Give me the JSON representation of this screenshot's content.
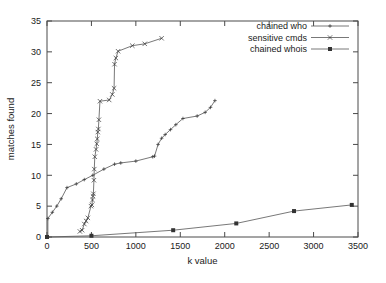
{
  "chart_data": {
    "type": "line",
    "title": "",
    "xlabel": "k value",
    "ylabel": "matches found",
    "xlim": [
      0,
      3500
    ],
    "ylim": [
      0,
      35
    ],
    "xticks": [
      0,
      500,
      1000,
      1500,
      2000,
      2500,
      3000,
      3500
    ],
    "yticks": [
      0,
      5,
      10,
      15,
      20,
      25,
      30,
      35
    ],
    "xtick_labels": [
      "0",
      "500",
      "1000",
      "1500",
      "2000",
      "2500",
      "3000",
      "3500"
    ],
    "ytick_labels": [
      "0",
      "5",
      "10",
      "15",
      "20",
      "25",
      "30",
      "35"
    ],
    "grid": false,
    "legend_position": "top-right",
    "series": [
      {
        "name": "chained who",
        "marker": "plus",
        "points": [
          [
            10,
            0
          ],
          [
            10,
            3
          ],
          [
            60,
            4
          ],
          [
            110,
            5
          ],
          [
            160,
            6.2
          ],
          [
            225,
            8
          ],
          [
            330,
            8.6
          ],
          [
            420,
            9.3
          ],
          [
            515,
            10
          ],
          [
            640,
            11
          ],
          [
            760,
            11.8
          ],
          [
            830,
            12
          ],
          [
            1000,
            12.3
          ],
          [
            1190,
            13
          ],
          [
            1210,
            13.1
          ],
          [
            1250,
            15
          ],
          [
            1290,
            16
          ],
          [
            1330,
            16.6
          ],
          [
            1390,
            17.4
          ],
          [
            1450,
            18.2
          ],
          [
            1530,
            19.2
          ],
          [
            1690,
            19.6
          ],
          [
            1780,
            20.2
          ],
          [
            1840,
            21
          ],
          [
            1890,
            22.1
          ]
        ]
      },
      {
        "name": "sensitive cmds",
        "marker": "cross",
        "points": [
          [
            370,
            0.9
          ],
          [
            395,
            1.1
          ],
          [
            420,
            2.1
          ],
          [
            440,
            2.6
          ],
          [
            460,
            3.1
          ],
          [
            495,
            5
          ],
          [
            505,
            5.2
          ],
          [
            512,
            6
          ],
          [
            518,
            6.6
          ],
          [
            522,
            7
          ],
          [
            528,
            9.2
          ],
          [
            532,
            11
          ],
          [
            538,
            13
          ],
          [
            552,
            14.2
          ],
          [
            560,
            15.1
          ],
          [
            566,
            15.9
          ],
          [
            572,
            17
          ],
          [
            578,
            17.5
          ],
          [
            584,
            19
          ],
          [
            596,
            22
          ],
          [
            700,
            22.2
          ],
          [
            735,
            23.1
          ],
          [
            755,
            24.1
          ],
          [
            760,
            28
          ],
          [
            775,
            29
          ],
          [
            800,
            30.1
          ],
          [
            960,
            31
          ],
          [
            1100,
            31.3
          ],
          [
            1290,
            32.2
          ]
        ]
      },
      {
        "name": "chained whois",
        "marker": "square",
        "points": [
          [
            0,
            0
          ],
          [
            500,
            0.2
          ],
          [
            1420,
            1.1
          ],
          [
            2130,
            2.2
          ],
          [
            2780,
            4.2
          ],
          [
            3430,
            5.2
          ]
        ]
      }
    ]
  },
  "legend": {
    "entries": [
      {
        "label": "chained who",
        "marker": "plus"
      },
      {
        "label": "sensitive cmds",
        "marker": "cross"
      },
      {
        "label": "chained whois",
        "marker": "square"
      }
    ]
  },
  "colors": {
    "line": "#555555",
    "axis": "#4a4a4a",
    "text": "#1a1a1a",
    "background": "#ffffff"
  }
}
